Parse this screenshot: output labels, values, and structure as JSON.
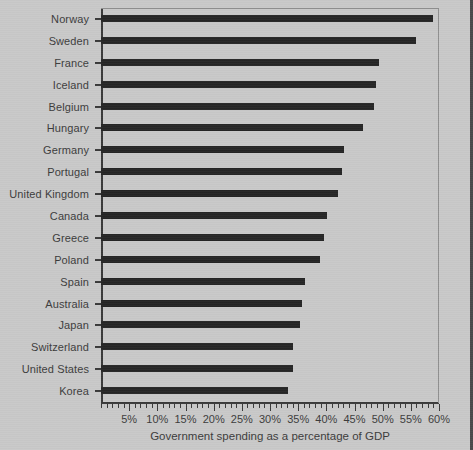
{
  "chart_data": {
    "type": "bar",
    "orientation": "horizontal",
    "title": "",
    "xlabel": "Government spending as a percentage of GDP",
    "ylabel": "",
    "xlim": [
      0,
      60
    ],
    "xtick_labels": [
      "5%",
      "10%",
      "15%",
      "20%",
      "25%",
      "30%",
      "35%",
      "40%",
      "45%",
      "50%",
      "55%",
      "60%"
    ],
    "xtick_values": [
      5,
      10,
      15,
      20,
      25,
      30,
      35,
      40,
      45,
      50,
      55,
      60
    ],
    "minor_tick_step": 1,
    "grid": false,
    "legend": null,
    "bar_color": "#262626",
    "background_color": "#c9c9c9",
    "axis_color": "#3a3a3a",
    "categories": [
      "Norway",
      "Sweden",
      "France",
      "Iceland",
      "Belgium",
      "Hungary",
      "Germany",
      "Portugal",
      "United Kingdom",
      "Canada",
      "Greece",
      "Poland",
      "Spain",
      "Australia",
      "Japan",
      "Switzerland",
      "United States",
      "Korea"
    ],
    "values": [
      59.0,
      56.0,
      49.3,
      48.8,
      48.5,
      46.5,
      43.2,
      42.8,
      42.0,
      40.2,
      39.6,
      38.8,
      36.3,
      35.6,
      35.3,
      34.0,
      34.0,
      33.2
    ],
    "series": [
      {
        "name": "Government spending as a percentage of GDP",
        "values": [
          59.0,
          56.0,
          49.3,
          48.8,
          48.5,
          46.5,
          43.2,
          42.8,
          42.0,
          40.2,
          39.6,
          38.8,
          36.3,
          35.6,
          35.3,
          34.0,
          34.0,
          33.2
        ]
      }
    ]
  }
}
